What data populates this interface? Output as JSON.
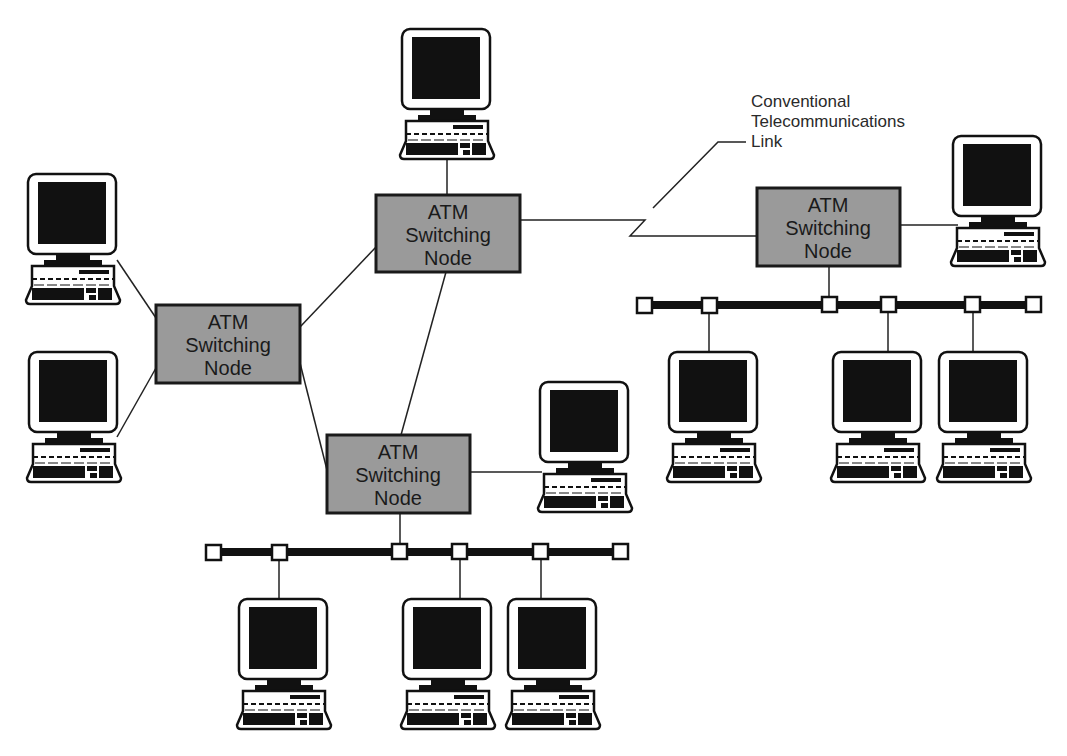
{
  "diagram": {
    "colors": {
      "node_fill": "#9a9a9a",
      "line": "#222222",
      "screen": "#111111",
      "background": "#ffffff"
    },
    "switching_nodes": [
      {
        "id": "node-top",
        "line1": "ATM",
        "line2": "Switching",
        "line3": "Node"
      },
      {
        "id": "node-left",
        "line1": "ATM",
        "line2": "Switching",
        "line3": "Node"
      },
      {
        "id": "node-bottom",
        "line1": "ATM",
        "line2": "Switching",
        "line3": "Node"
      },
      {
        "id": "node-right",
        "line1": "ATM",
        "line2": "Switching",
        "line3": "Node"
      }
    ],
    "callout": {
      "line1": "Conventional",
      "line2": "Telecommunications",
      "line3": "Link"
    },
    "workstations_count": 13,
    "icons": {
      "workstation": "computer-icon",
      "bus_tap": "bus-tap-icon"
    }
  }
}
